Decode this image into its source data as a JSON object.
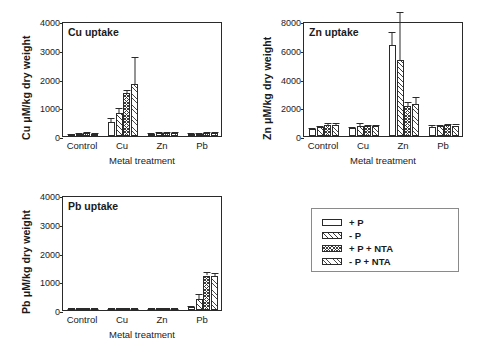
{
  "figure": {
    "xlabel": "Metal treatment",
    "categories": [
      "Control",
      "Cu",
      "Zn",
      "Pb"
    ]
  },
  "legend": {
    "items": [
      {
        "label": "+ P",
        "pattern": "plain"
      },
      {
        "label": "- P",
        "pattern": "diagonal"
      },
      {
        "label": "+ P + NTA",
        "pattern": "cross-hatch"
      },
      {
        "label": "- P + NTA",
        "pattern": "diagonal-fine"
      }
    ]
  },
  "chart_data": [
    {
      "type": "bar",
      "id": "cu-uptake",
      "title": "Cu uptake",
      "xlabel": "Metal treatment",
      "ylabel": "Cu μM/kg dry weight",
      "categories": [
        "Control",
        "Cu",
        "Zn",
        "Pb"
      ],
      "ylim": [
        0,
        4000
      ],
      "yticks": [
        0,
        1000,
        2000,
        3000,
        4000
      ],
      "grid": false,
      "legend_position": "external",
      "series": [
        {
          "name": "+ P",
          "values": [
            60,
            500,
            80,
            70
          ],
          "errors": [
            25,
            120,
            30,
            25
          ]
        },
        {
          "name": "- P",
          "values": [
            70,
            800,
            90,
            80
          ],
          "errors": [
            30,
            180,
            35,
            30
          ]
        },
        {
          "name": "+ P + NTA",
          "values": [
            90,
            1500,
            110,
            100
          ],
          "errors": [
            35,
            110,
            40,
            35
          ]
        },
        {
          "name": "- P + NTA",
          "values": [
            85,
            1800,
            105,
            95
          ],
          "errors": [
            30,
            950,
            40,
            35
          ]
        }
      ]
    },
    {
      "type": "bar",
      "id": "zn-uptake",
      "title": "Zn uptake",
      "xlabel": "Metal treatment",
      "ylabel": "Zn μM/kg dry weight",
      "categories": [
        "Control",
        "Cu",
        "Zn",
        "Pb"
      ],
      "ylim": [
        0,
        8000
      ],
      "yticks": [
        0,
        2000,
        4000,
        6000,
        8000
      ],
      "grid": false,
      "legend_position": "external",
      "series": [
        {
          "name": "+ P",
          "values": [
            480,
            560,
            6350,
            650
          ],
          "errors": [
            60,
            90,
            900,
            90
          ]
        },
        {
          "name": "- P",
          "values": [
            620,
            700,
            5300,
            680
          ],
          "errors": [
            80,
            200,
            3300,
            90
          ]
        },
        {
          "name": "+ P + NTA",
          "values": [
            760,
            700,
            2100,
            750
          ],
          "errors": [
            110,
            90,
            250,
            100
          ]
        },
        {
          "name": "- P + NTA",
          "values": [
            790,
            700,
            2250,
            730
          ],
          "errors": [
            130,
            90,
            450,
            90
          ]
        }
      ]
    },
    {
      "type": "bar",
      "id": "pb-uptake",
      "title": "Pb uptake",
      "xlabel": "Metal treatment",
      "ylabel": "Pb μM/kg dry weight",
      "categories": [
        "Control",
        "Cu",
        "Zn",
        "Pb"
      ],
      "ylim": [
        0,
        4000
      ],
      "yticks": [
        0,
        1000,
        2000,
        3000,
        4000
      ],
      "grid": false,
      "legend_position": "external",
      "series": [
        {
          "name": "+ P",
          "values": [
            15,
            20,
            12,
            110
          ],
          "errors": [
            8,
            10,
            6,
            40
          ]
        },
        {
          "name": "- P",
          "values": [
            18,
            22,
            14,
            400
          ],
          "errors": [
            8,
            10,
            6,
            150
          ]
        },
        {
          "name": "+ P + NTA",
          "values": [
            20,
            25,
            16,
            1200
          ],
          "errors": [
            8,
            10,
            6,
            110
          ]
        },
        {
          "name": "- P + NTA",
          "values": [
            20,
            24,
            15,
            1190
          ],
          "errors": [
            8,
            10,
            6,
            100
          ]
        }
      ]
    }
  ]
}
